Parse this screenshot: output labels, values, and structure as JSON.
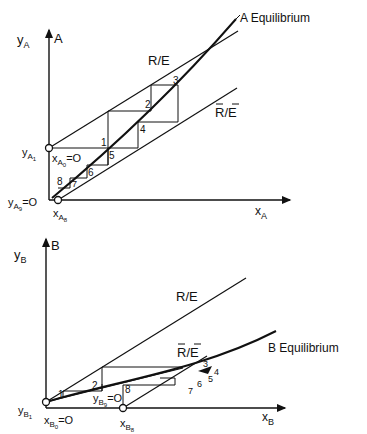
{
  "panels": {
    "top": {
      "axis_title": "A",
      "y_label": "y",
      "y_sub": "A",
      "x_label": "x",
      "x_sub": "A",
      "curve_label": "A Equilibrium",
      "upper_line_label": "R/E",
      "lower_line_label": "R/E",
      "lower_line_overbar": true,
      "point_labels": {
        "y1_main": "y",
        "y1_sub": "A",
        "y1_subsub": "1",
        "y9_main": "y",
        "y9_sub": "A",
        "y9_subsub": "9",
        "y9_eq": "=O",
        "x0_main": "x",
        "x0_sub": "A",
        "x0_subsub": "0",
        "x0_eq": "=O",
        "x8_main": "x",
        "x8_sub": "A",
        "x8_subsub": "8"
      },
      "steps": [
        "1",
        "2",
        "3",
        "4",
        "5",
        "6",
        "7",
        "8"
      ]
    },
    "bottom": {
      "axis_title": "B",
      "y_label": "y",
      "y_sub": "B",
      "x_label": "x",
      "x_sub": "B",
      "curve_label": "B  Equilibrium",
      "upper_line_label": "R/E",
      "lower_line_label": "R/E",
      "lower_line_overbar": true,
      "point_labels": {
        "y1_main": "y",
        "y1_sub": "B",
        "y1_subsub": "1",
        "y9_main": "y",
        "y9_sub": "B",
        "y9_subsub": "9",
        "y9_eq": "=O",
        "x0_main": "x",
        "x0_sub": "B",
        "x0_subsub": "0",
        "x0_eq": "=O",
        "x8_main": "x",
        "x8_sub": "B",
        "x8_subsub": "8"
      },
      "steps": [
        "1",
        "2",
        "3",
        "4",
        "5",
        "6",
        "7",
        "8"
      ]
    }
  }
}
